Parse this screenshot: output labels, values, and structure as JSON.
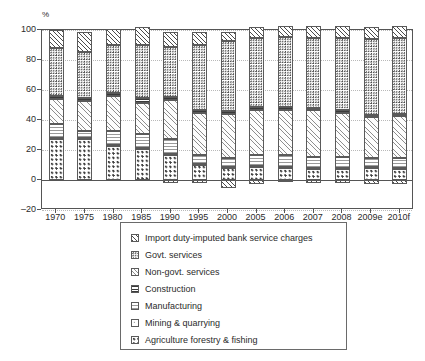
{
  "chart_data": {
    "type": "bar",
    "subtype": "stacked-bar-percentage",
    "title": "",
    "xlabel": "",
    "ylabel": "%",
    "ylim": [
      -20,
      100
    ],
    "yticks": [
      -20,
      0,
      20,
      40,
      60,
      80,
      100
    ],
    "grid": true,
    "legend_position": "bottom",
    "categories": [
      "1970",
      "1975",
      "1980",
      "1985",
      "1990",
      "1995",
      "2000",
      "2005",
      "2006",
      "2007",
      "2008",
      "2009e",
      "2010f"
    ],
    "series": [
      {
        "name": "Agriculture forestry & fishing",
        "pattern": "polka-dots",
        "values": [
          27.5,
          27.5,
          23.0,
          21.0,
          17.0,
          10.5,
          8.5,
          9.0,
          8.0,
          7.5,
          7.5,
          8.0,
          7.5
        ]
      },
      {
        "name": "Mining & quarrying",
        "pattern": "sparse-dots",
        "values": [
          0.5,
          0.5,
          0.5,
          0.5,
          0.5,
          0.5,
          0.5,
          0.5,
          0.5,
          0.5,
          0.5,
          0.5,
          0.5
        ]
      },
      {
        "name": "Manufacturing",
        "pattern": "horizontal-dotted-lines",
        "values": [
          9.5,
          4.5,
          9.5,
          9.0,
          10.0,
          6.0,
          6.0,
          7.5,
          8.0,
          7.5,
          7.5,
          6.0,
          6.5
        ]
      },
      {
        "name": "Non-govt. services",
        "pattern": "fine-diagonal-hatch",
        "values": [
          16.5,
          20.0,
          23.0,
          21.0,
          26.0,
          28.0,
          29.0,
          29.5,
          30.0,
          31.0,
          29.5,
          27.5,
          28.0
        ]
      },
      {
        "name": "Construction",
        "pattern": "horizontal-dark-lines",
        "values": [
          2.0,
          2.5,
          2.0,
          3.0,
          2.0,
          2.0,
          2.0,
          2.0,
          2.0,
          1.5,
          1.5,
          1.5,
          1.5
        ]
      },
      {
        "name": "Govt. services",
        "pattern": "dense-checker-dots",
        "values": [
          32.0,
          30.5,
          32.0,
          35.5,
          33.5,
          43.0,
          47.0,
          46.0,
          47.0,
          46.5,
          48.0,
          50.5,
          50.5
        ]
      },
      {
        "name": "Import duty-imputed bank service charges",
        "pattern": "diagonal-hatch",
        "values": [
          12.0,
          13.0,
          11.0,
          12.0,
          10.0,
          8.5,
          5.5,
          7.5,
          7.5,
          8.5,
          8.0,
          8.0,
          8.0
        ]
      },
      {
        "name": "Import duty-imputed bank service charges (negative)",
        "pattern": "diagonal-hatch",
        "values": [
          0,
          0,
          0,
          0,
          -2.0,
          -2.0,
          -5.5,
          -2.5,
          -1.5,
          -2.0,
          -2.0,
          -2.5,
          -2.5
        ]
      }
    ]
  },
  "axis": {
    "y_label": "%",
    "y_tick_labels": [
      "100",
      "80",
      "60",
      "40",
      "20",
      "0",
      "-20"
    ],
    "x_tick_labels": [
      "1970",
      "1975",
      "1980",
      "1985",
      "1990",
      "1995",
      "2000",
      "2005",
      "2006",
      "2007",
      "2008",
      "2009e",
      "2010f"
    ]
  },
  "legend": {
    "items": [
      {
        "label": "Import duty-imputed bank service charges",
        "pattern_class": "p-import"
      },
      {
        "label": "Govt. services",
        "pattern_class": "p-govt"
      },
      {
        "label": "Non-govt. services",
        "pattern_class": "p-nongovt"
      },
      {
        "label": "Construction",
        "pattern_class": "p-constr"
      },
      {
        "label": "Manufacturing",
        "pattern_class": "p-manu"
      },
      {
        "label": "Mining & quarrying",
        "pattern_class": "p-mining"
      },
      {
        "label": "Agriculture forestry & fishing",
        "pattern_class": "p-agri"
      }
    ]
  },
  "colors": {
    "axis": "#555555",
    "grid": "#b9b9b9",
    "text": "#2b2b2b",
    "background": "#ffffff"
  }
}
